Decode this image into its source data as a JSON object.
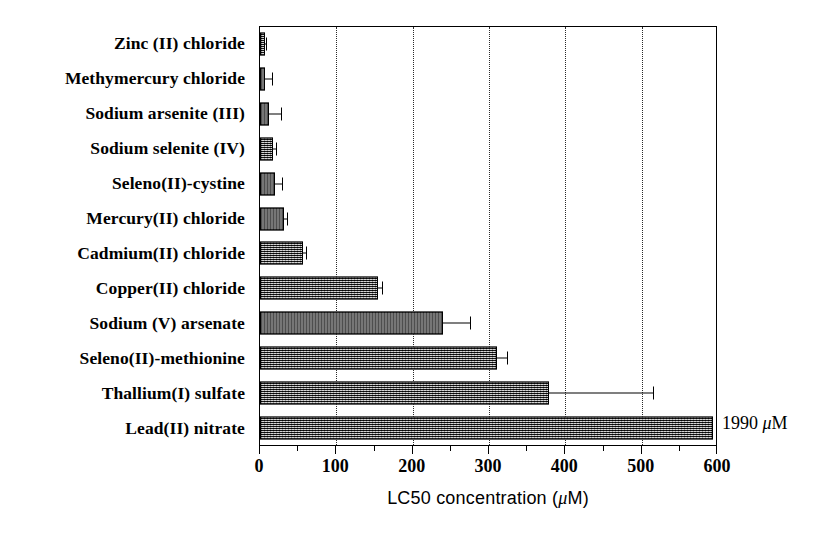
{
  "chart_data": {
    "type": "bar",
    "orientation": "horizontal",
    "title": "",
    "xlabel": "LC50 concentration (μM)",
    "ylabel": "",
    "xlim": [
      0,
      600
    ],
    "xticks": [
      0,
      100,
      200,
      300,
      400,
      500,
      600
    ],
    "xticklabels": [
      "0",
      "100",
      "200",
      "300",
      "400",
      "500",
      "600"
    ],
    "minor_xticks": [
      50,
      150,
      250,
      350,
      450,
      550
    ],
    "gridlines": {
      "x": [
        100,
        200,
        300,
        400,
        500
      ],
      "style": "dotted"
    },
    "legend": null,
    "categories": [
      "Zinc (II) chloride",
      "Methymercury chloride",
      "Sodium arsenite (III)",
      "Sodium selenite (IV)",
      "Seleno(II)-cystine",
      "Mercury(II) chloride",
      "Cadmium(II) chloride",
      "Copper(II) chloride",
      "Sodium (V) arsenate",
      "Seleno(II)-methionine",
      "Thallium(I) sulfate",
      "Lead(II) nitrate"
    ],
    "values": [
      6,
      7,
      12,
      17,
      20,
      32,
      56,
      154,
      240,
      310,
      378,
      1990
    ],
    "errors": [
      2,
      9,
      16,
      4,
      9,
      4,
      4,
      6,
      35,
      14,
      137,
      0
    ],
    "bar_fill": "#6e6e6e",
    "bar_edge": "#000000",
    "annotations": [
      {
        "text": "1990 μM",
        "for_category": "Lead(II) nitrate",
        "note": "value exceeds axis maximum"
      }
    ]
  },
  "axis": {
    "title_prefix": "LC50 concentration (",
    "title_mu": "μ",
    "title_suffix": "M)"
  },
  "annotation": {
    "value_label": "1990",
    "mu": "μ",
    "unit_suffix": "M"
  }
}
